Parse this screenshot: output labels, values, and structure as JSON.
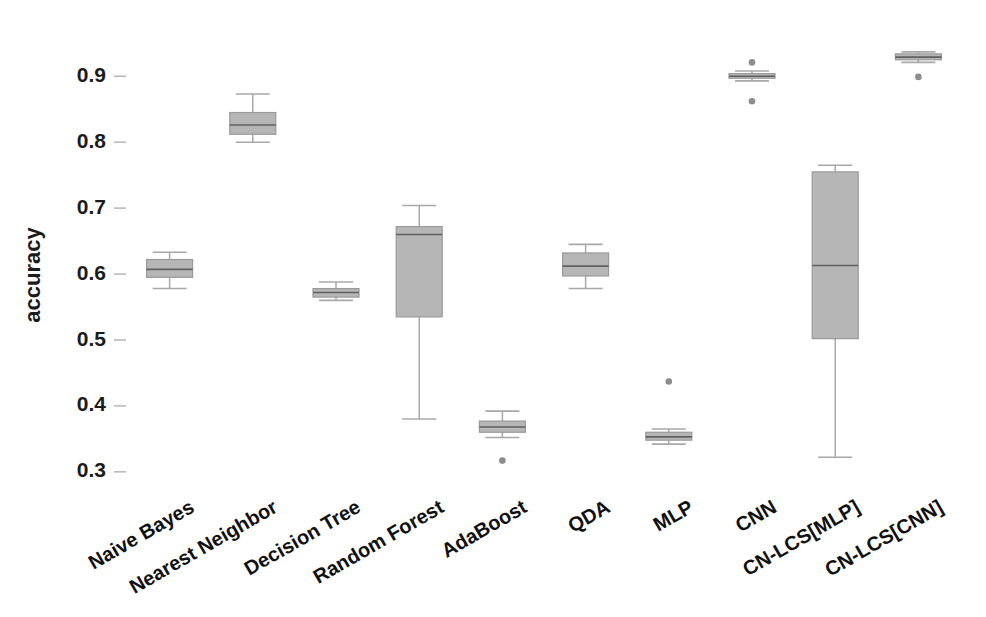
{
  "chart_data": {
    "type": "box",
    "title": "",
    "xlabel": "",
    "ylabel": "accuracy",
    "ylim": [
      0.28,
      0.955
    ],
    "yticks": [
      0.3,
      0.4,
      0.5,
      0.6,
      0.7,
      0.8,
      0.9
    ],
    "ytick_labels": [
      "0.3",
      "0.4",
      "0.5",
      "0.6",
      "0.7",
      "0.8",
      "0.9"
    ],
    "grid": false,
    "legend": "none",
    "xtick_rotation": -30,
    "categories": [
      "Naive Bayes",
      "Nearest Neighbor",
      "Decision Tree",
      "Random Forest",
      "AdaBoost",
      "QDA",
      "MLP",
      "CNN",
      "CN-LCS[MLP]",
      "CN-LCS[CNN]"
    ],
    "boxes": [
      {
        "label": "Naive Bayes",
        "whisker_low": 0.578,
        "q1": 0.595,
        "median": 0.607,
        "q3": 0.622,
        "whisker_high": 0.633,
        "outliers": []
      },
      {
        "label": "Nearest Neighbor",
        "whisker_low": 0.8,
        "q1": 0.812,
        "median": 0.826,
        "q3": 0.845,
        "whisker_high": 0.873,
        "outliers": []
      },
      {
        "label": "Decision Tree",
        "whisker_low": 0.56,
        "q1": 0.565,
        "median": 0.572,
        "q3": 0.578,
        "whisker_high": 0.588,
        "outliers": []
      },
      {
        "label": "Random Forest",
        "whisker_low": 0.38,
        "q1": 0.535,
        "median": 0.66,
        "q3": 0.672,
        "whisker_high": 0.704,
        "outliers": []
      },
      {
        "label": "AdaBoost",
        "whisker_low": 0.352,
        "q1": 0.36,
        "median": 0.368,
        "q3": 0.377,
        "whisker_high": 0.392,
        "outliers": [
          0.317
        ]
      },
      {
        "label": "QDA",
        "whisker_low": 0.578,
        "q1": 0.597,
        "median": 0.612,
        "q3": 0.632,
        "whisker_high": 0.645,
        "outliers": []
      },
      {
        "label": "MLP",
        "whisker_low": 0.342,
        "q1": 0.348,
        "median": 0.353,
        "q3": 0.36,
        "whisker_high": 0.365,
        "outliers": [
          0.437
        ]
      },
      {
        "label": "CNN",
        "whisker_low": 0.893,
        "q1": 0.897,
        "median": 0.9,
        "q3": 0.904,
        "whisker_high": 0.908,
        "outliers": [
          0.921,
          0.862
        ]
      },
      {
        "label": "CN-LCS[MLP]",
        "whisker_low": 0.322,
        "q1": 0.502,
        "median": 0.613,
        "q3": 0.755,
        "whisker_high": 0.765,
        "outliers": []
      },
      {
        "label": "CN-LCS[CNN]",
        "whisker_low": 0.921,
        "q1": 0.925,
        "median": 0.929,
        "q3": 0.934,
        "whisker_high": 0.937,
        "outliers": [
          0.899
        ]
      }
    ],
    "colors": {
      "box_fill": "#b6b6b6",
      "box_edge": "#9a9a9a",
      "median": "#5f5f5f",
      "whisker": "#a8a8a8",
      "flier": "#8d8d8d",
      "tick": "#b9b9b9",
      "text": "#1b1b1b",
      "background": "#ffffff"
    }
  }
}
